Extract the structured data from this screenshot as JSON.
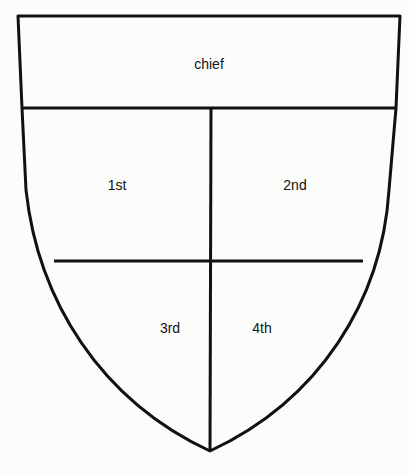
{
  "diagram": {
    "sections": [
      {
        "id": "chief",
        "label": "chief"
      },
      {
        "id": "first",
        "label": "1st"
      },
      {
        "id": "second",
        "label": "2nd"
      },
      {
        "id": "third",
        "label": "3rd"
      },
      {
        "id": "fourth",
        "label": "4th"
      }
    ],
    "colors": {
      "stroke": "#111111",
      "background": "#fcfcfb"
    }
  }
}
